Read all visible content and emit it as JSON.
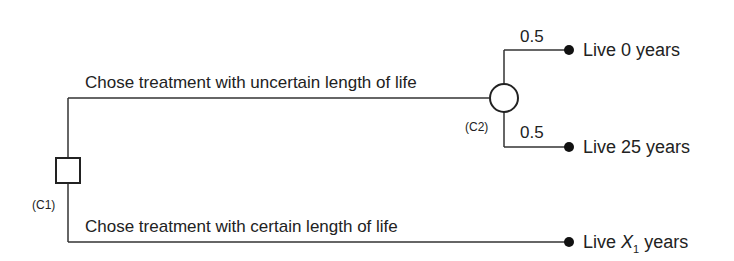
{
  "diagram": {
    "type": "decision-tree",
    "nodes": {
      "decision": {
        "label": "(C1)",
        "shape": "square"
      },
      "chance": {
        "label": "(C2)",
        "shape": "circle"
      }
    },
    "branches": {
      "uncertain": {
        "label": "Chose treatment with uncertain length of life"
      },
      "certain": {
        "label": "Chose treatment with certain length of life"
      }
    },
    "chance_outcomes": [
      {
        "probability": "0.5",
        "outcome": "Live 0 years"
      },
      {
        "probability": "0.5",
        "outcome": "Live 25 years"
      }
    ],
    "certain_outcome": {
      "prefix": "Live ",
      "variable": "X",
      "subscript": "1",
      "suffix": " years"
    }
  }
}
